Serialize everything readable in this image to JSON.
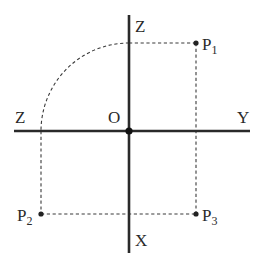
{
  "diagram": {
    "type": "orthographic-projection-axes",
    "colors": {
      "background": "#ffffff",
      "ink": "#2a2a2a"
    },
    "origin": {
      "label": "O",
      "x": 129,
      "y": 131
    },
    "axes": {
      "vertical_top": {
        "label": "Z"
      },
      "vertical_bottom": {
        "label": "X"
      },
      "horizontal_left": {
        "label": "Z"
      },
      "horizontal_right": {
        "label": "Y"
      }
    },
    "points": [
      {
        "id": "P1",
        "label": "P",
        "subscript": "1",
        "x": 196,
        "y": 43
      },
      {
        "id": "P2",
        "label": "P",
        "subscript": "2",
        "x": 41,
        "y": 214
      },
      {
        "id": "P3",
        "label": "P",
        "subscript": "3",
        "x": 196,
        "y": 214
      }
    ],
    "construction_lines": [
      {
        "from": "P1",
        "to": "Z-axis (top)",
        "style": "dashed"
      },
      {
        "from": "P1",
        "to": "P3",
        "style": "dashed"
      },
      {
        "from": "P2",
        "to": "P3",
        "style": "dashed"
      },
      {
        "from": "P2",
        "to": "Z-axis (left)",
        "style": "dashed"
      },
      {
        "type": "quarter-arc",
        "center": "O",
        "from": "Z-axis (top)",
        "to": "Z-axis (left)",
        "style": "dashed"
      }
    ]
  }
}
